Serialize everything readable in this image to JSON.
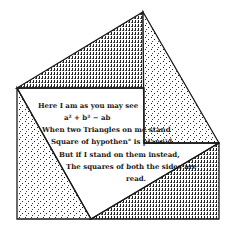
{
  "diagram": {
    "type": "pythagorean-proof-illustration",
    "stroke_color": "#1a1a1a",
    "fill_color": "#ffffff",
    "stipple_color": "#222222",
    "shapes": {
      "top_triangle": [
        [
          17,
          88
        ],
        [
          143,
          12
        ],
        [
          144,
          88
        ]
      ],
      "right_triangle": [
        [
          143,
          12
        ],
        [
          219,
          143
        ],
        [
          144,
          143
        ]
      ],
      "left_triangle": [
        [
          17,
          88
        ],
        [
          17,
          219
        ],
        [
          91,
          219
        ]
      ],
      "bottom_triangle": [
        [
          91,
          219
        ],
        [
          219,
          143
        ],
        [
          219,
          219
        ]
      ]
    },
    "verse": {
      "lines": [
        "Here I am as you may see",
        "a² + b² − ab",
        "When two Triangles on me stand",
        "Square of hypothen° is plann'd",
        "But if I stand on them instead,",
        "The squares of both the sides are",
        "read."
      ]
    }
  }
}
